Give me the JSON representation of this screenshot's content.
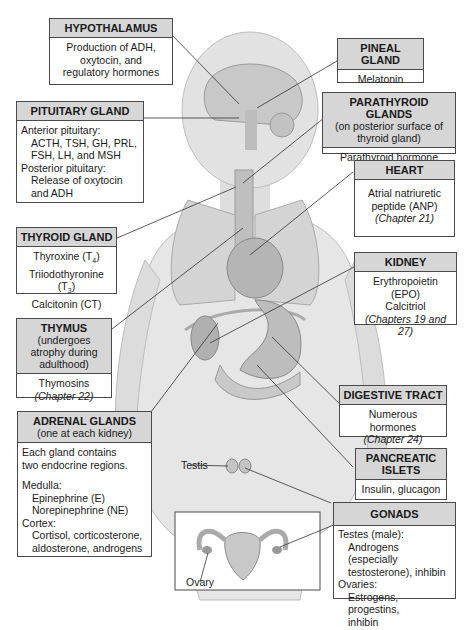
{
  "boxes": {
    "hypothalamus": {
      "title": "HYPOTHALAMUS",
      "lines": [
        "Production of ADH,",
        "oxytocin, and",
        "regulatory hormones"
      ]
    },
    "pituitary": {
      "title": "PITUITARY GLAND",
      "lines": [
        "Anterior pituitary:",
        "ACTH, TSH, GH, PRL,",
        "FSH, LH, and MSH",
        "Posterior pituitary:",
        "Release of oxytocin",
        "and ADH"
      ]
    },
    "thyroid": {
      "title": "THYROID GLAND",
      "lines": [
        "Thyroxine (T",
        "4",
        ")",
        "Triiodothyronine (T",
        "3",
        ")",
        "Calcitonin (CT)"
      ]
    },
    "thymus": {
      "title": "THYMUS",
      "subtitle": "(undergoes atrophy during adulthood)",
      "lines": [
        "Thymosins"
      ],
      "chapter": "(Chapter 22)"
    },
    "adrenal": {
      "title": "ADRENAL GLANDS",
      "subtitle": "(one at each kidney)",
      "lines": [
        "Each gland contains",
        "two endocrine regions.",
        "Medulla:",
        "Epinephrine (E)",
        "Norepinephrine (NE)",
        "Cortex:",
        "Cortisol, corticosterone,",
        "aldosterone, androgens"
      ]
    },
    "pineal": {
      "title": "PINEAL GLAND",
      "lines": [
        "Melatonin"
      ]
    },
    "parathyroid": {
      "title": "PARATHYROID GLANDS",
      "subtitle": "(on posterior surface of thyroid gland)",
      "lines": [
        "Parathyroid hormone (PTH)"
      ]
    },
    "heart": {
      "title": "HEART",
      "lines": [
        "Atrial natriuretic",
        "peptide (ANP)"
      ],
      "chapter": "(Chapter 21)"
    },
    "kidney": {
      "title": "KIDNEY",
      "lines": [
        "Erythropoietin (EPO)",
        "Calcitriol"
      ],
      "chapter": "(Chapters 19 and 27)"
    },
    "digestive": {
      "title": "DIGESTIVE TRACT",
      "lines": [
        "Numerous hormones"
      ],
      "chapter": "(Chapter 24)"
    },
    "pancreatic": {
      "title": "PANCREATIC ISLETS",
      "lines": [
        "Insulin, glucagon"
      ]
    },
    "gonads": {
      "title": "GONADS",
      "lines": [
        "Testes (male):",
        "Androgens (especially",
        "testosterone), inhibin",
        "Ovaries:",
        "Estrogens, progestins,",
        "inhibin"
      ]
    }
  },
  "labels": {
    "testis": "Testis",
    "ovary": "Ovary"
  },
  "colors": {
    "header_bg": "#d6d6d6",
    "border": "#4a4a4a",
    "skin": "#e4e4e4",
    "organ": "#b8b8b8"
  }
}
